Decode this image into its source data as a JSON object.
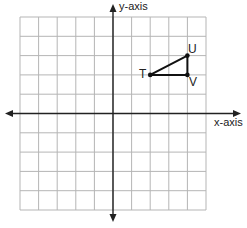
{
  "axes": {
    "x_label": "x-axis",
    "y_label": "y-axis",
    "range": {
      "x": [
        -5,
        5
      ],
      "y": [
        -5,
        5
      ]
    },
    "grid_step": 1
  },
  "triangle": {
    "points": [
      {
        "name": "T",
        "x": 2,
        "y": 2
      },
      {
        "name": "U",
        "x": 4,
        "y": 3
      },
      {
        "name": "V",
        "x": 4,
        "y": 2
      }
    ]
  },
  "colors": {
    "grid": "#b5b5b5",
    "axis": "#222222",
    "shape": "#111111"
  }
}
